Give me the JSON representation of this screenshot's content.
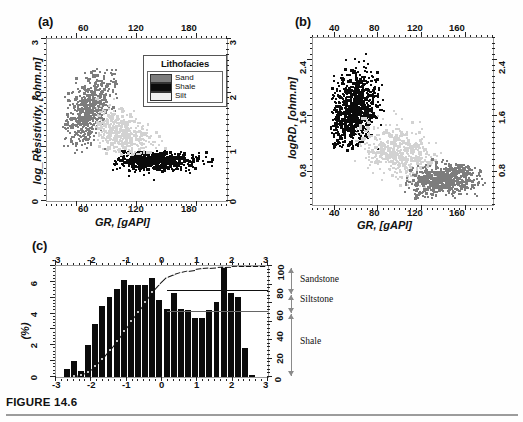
{
  "figure": {
    "caption": "FIGURE 14.6",
    "colors": {
      "sand": "#7d7d7d",
      "shale": "#0b0b0b",
      "silt": "#d2d2d2",
      "frame": "#9a9a9a",
      "arrow": "#8a8a8a"
    }
  },
  "panel_a": {
    "tag": "(a)",
    "xlabel": "GR, [gAPI]",
    "ylabel": "log_Resistivity, [ohm.m]",
    "xticks": [
      "60",
      "120",
      "180"
    ],
    "yticks": [
      "0",
      "1",
      "2",
      "3"
    ],
    "legend": {
      "title": "Lithofacies",
      "items": [
        {
          "label": "Sand",
          "color": "#7d7d7d"
        },
        {
          "label": "Shale",
          "color": "#0b0b0b"
        },
        {
          "label": "Silt",
          "color": "#d2d2d2"
        }
      ]
    }
  },
  "panel_b": {
    "tag": "(b)",
    "xlabel": "GR, [gAPI]",
    "ylabel": "logRD, [ohm.m]",
    "xticks": [
      "40",
      "80",
      "120",
      "160"
    ],
    "yticks": [
      "0.8",
      "1.6",
      "2.4"
    ]
  },
  "panel_c": {
    "tag": "(c)",
    "ylabel": "(%)",
    "xticks": [
      "-3",
      "-2",
      "-1",
      "0",
      "1",
      "2",
      "3"
    ],
    "yticks_left": [
      "0",
      "2",
      "4",
      "6"
    ],
    "yticks_right": [
      "0",
      "20",
      "40",
      "60",
      "80",
      "100"
    ],
    "facies": [
      {
        "label": "Sandstone"
      },
      {
        "label": "Siltstone"
      },
      {
        "label": "Shale"
      }
    ]
  },
  "chart_data": [
    {
      "id": "panel_a",
      "type": "scatter",
      "title": "(a)",
      "xlabel": "GR, [gAPI]",
      "ylabel": "log_Resistivity, [ohm.m]",
      "xlim": [
        30,
        210
      ],
      "ylim": [
        0,
        3
      ],
      "xticks": [
        60,
        120,
        180
      ],
      "yticks": [
        0,
        1,
        2,
        3
      ],
      "grid": false,
      "legend_position": "top-right",
      "legend_title": "Lithofacies",
      "series": [
        {
          "name": "Sand",
          "color": "#7d7d7d",
          "n_points": 600,
          "cluster": {
            "x_center": 72,
            "y_center": 1.75,
            "x_spread": 12,
            "y_spread": 0.34,
            "correlation": 0.55
          },
          "x_range": [
            46,
            100
          ],
          "y_range": [
            0.85,
            2.45
          ]
        },
        {
          "name": "Shale",
          "color": "#0b0b0b",
          "n_points": 650,
          "cluster": {
            "x_center": 135,
            "y_center": 0.78,
            "x_spread": 22,
            "y_spread": 0.09,
            "correlation": 0.0
          },
          "x_range": [
            95,
            195
          ],
          "y_range": [
            0.42,
            0.95
          ]
        },
        {
          "name": "Silt",
          "color": "#d2d2d2",
          "n_points": 520,
          "cluster": {
            "x_center": 103,
            "y_center": 1.25,
            "x_spread": 16,
            "y_spread": 0.26,
            "correlation": -0.45
          },
          "x_range": [
            78,
            150
          ],
          "y_range": [
            0.88,
            2.0
          ]
        }
      ]
    },
    {
      "id": "panel_b",
      "type": "scatter",
      "title": "(b)",
      "xlabel": "GR, [gAPI]",
      "ylabel": "logRD, [ohm.m]",
      "xlim": [
        20,
        185
      ],
      "ylim": [
        0.45,
        2.85
      ],
      "xticks": [
        40,
        80,
        120,
        160
      ],
      "yticks": [
        0.8,
        1.6,
        2.4
      ],
      "grid": false,
      "series": [
        {
          "name": "high-resistivity-cluster",
          "color": "#0b0b0b",
          "n_points": 900,
          "cluster": {
            "x_center": 57,
            "y_center": 1.85,
            "x_spread": 10,
            "y_spread": 0.26,
            "correlation": 0.25
          },
          "x_range": [
            36,
            95
          ],
          "y_range": [
            1.25,
            2.72
          ]
        },
        {
          "name": "mid-resistivity-cluster",
          "color": "#d2d2d2",
          "n_points": 520,
          "cluster": {
            "x_center": 96,
            "y_center": 1.22,
            "x_spread": 17,
            "y_spread": 0.2,
            "correlation": -0.4
          },
          "x_range": [
            58,
            140
          ],
          "y_range": [
            0.72,
            1.82
          ]
        },
        {
          "name": "low-resistivity-cluster",
          "color": "#7d7d7d",
          "n_points": 620,
          "cluster": {
            "x_center": 137,
            "y_center": 0.83,
            "x_spread": 16,
            "y_spread": 0.11,
            "correlation": 0.15
          },
          "x_range": [
            103,
            178
          ],
          "y_range": [
            0.55,
            1.12
          ]
        }
      ]
    },
    {
      "id": "panel_c",
      "type": "bar",
      "title": "(c)",
      "xlabel": "",
      "ylabel": "(%)",
      "xlim": [
        -3,
        3
      ],
      "ylim": [
        0,
        7
      ],
      "y2lim": [
        0,
        100
      ],
      "y2label": "cumulative %",
      "xticks": [
        -3,
        -2,
        -1,
        0,
        1,
        2,
        3
      ],
      "yticks": [
        0,
        2,
        4,
        6
      ],
      "y2ticks": [
        0,
        20,
        40,
        60,
        80,
        100
      ],
      "grid": false,
      "bin_centers": [
        -2.9,
        -2.7,
        -2.5,
        -2.3,
        -2.1,
        -1.9,
        -1.7,
        -1.5,
        -1.3,
        -1.1,
        -0.9,
        -0.7,
        -0.5,
        -0.3,
        -0.1,
        0.1,
        0.3,
        0.5,
        0.7,
        0.9,
        1.1,
        1.3,
        1.5,
        1.7,
        1.9,
        2.1,
        2.3,
        2.5,
        2.7,
        2.9
      ],
      "values": [
        0.15,
        0.6,
        1.1,
        0.5,
        2.1,
        3.4,
        4.5,
        5.1,
        5.6,
        6.15,
        5.85,
        5.85,
        5.85,
        6.25,
        4.9,
        4.35,
        5.35,
        4.35,
        4.3,
        3.8,
        3.8,
        4.3,
        4.75,
        6.95,
        5.3,
        5.1,
        1.9,
        0.25,
        0.1,
        0.05
      ],
      "cumulative": [
        0.4,
        1.2,
        2.8,
        3.4,
        6.5,
        11.5,
        18.0,
        25.5,
        33.5,
        42.5,
        51.0,
        59.5,
        68.0,
        77.0,
        84.0,
        90.0,
        92.5,
        94.5,
        96.0,
        97.0,
        98.0,
        98.5,
        99.0,
        99.4,
        99.7,
        99.9,
        100.0,
        100.0,
        100.0,
        100.0
      ],
      "cutoffs": [
        {
          "label": "Shale",
          "cum_percent_upper": 60
        },
        {
          "label": "Siltstone",
          "cum_percent_upper": 79
        },
        {
          "label": "Sandstone",
          "cum_percent_upper": 100
        }
      ]
    }
  ]
}
